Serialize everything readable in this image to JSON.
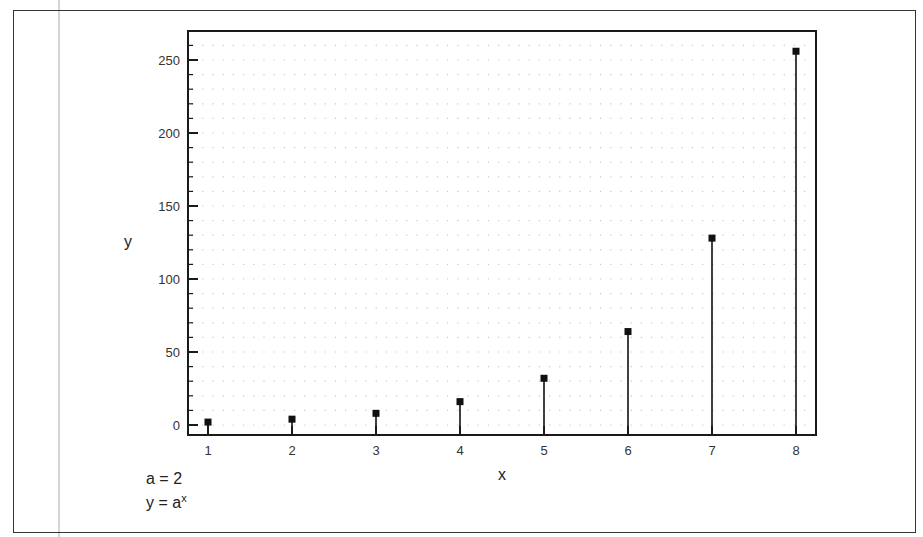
{
  "chart_data": {
    "type": "stem",
    "title": "",
    "xlabel": "x",
    "ylabel": "y",
    "x": [
      1,
      2,
      3,
      4,
      5,
      6,
      7,
      8
    ],
    "values": [
      2,
      4,
      8,
      16,
      32,
      64,
      128,
      256
    ],
    "series": [
      {
        "name": "y = a^x",
        "values": [
          2,
          4,
          8,
          16,
          32,
          64,
          128,
          256
        ]
      }
    ],
    "xticks": [
      "1",
      "2",
      "3",
      "4",
      "5",
      "6",
      "7",
      "8"
    ],
    "yticks": [
      "0",
      "50",
      "100",
      "150",
      "200",
      "250"
    ],
    "ylim": [
      -8,
      270
    ],
    "xlim": [
      0.75,
      8.25
    ],
    "grid": "dotted",
    "legend": null,
    "annotations": [
      "a = 2",
      "y = a^x"
    ]
  },
  "annotation": {
    "line1": "a = 2",
    "line2_base": "y = a",
    "line2_sup": "x"
  },
  "colors": {
    "axis": "#1a1a1a",
    "marker": "#111111",
    "grid": "#c8c8c8",
    "frame": "#333333"
  }
}
